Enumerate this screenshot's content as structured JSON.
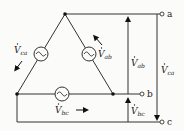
{
  "diagram": {
    "type": "delta-connected three-phase voltage source",
    "terminals": [
      {
        "id": "a",
        "label": "a"
      },
      {
        "id": "b",
        "label": "b"
      },
      {
        "id": "c",
        "label": "c"
      }
    ],
    "sources": [
      {
        "id": "Vca",
        "label_main": "V",
        "label_sub": "ca",
        "position": "left-leg"
      },
      {
        "id": "Vab",
        "label_main": "V",
        "label_sub": "ab",
        "position": "right-leg"
      },
      {
        "id": "Vbc",
        "label_main": "V",
        "label_sub": "bc",
        "position": "bottom"
      }
    ],
    "line_voltages": [
      {
        "id": "Vab_line",
        "label_main": "V",
        "label_sub": "ab",
        "from": "b",
        "to": "a",
        "arrow": "up"
      },
      {
        "id": "Vca_line",
        "label_main": "V",
        "label_sub": "ca",
        "from": "a",
        "to": "c",
        "arrow": "down"
      },
      {
        "id": "Vbc_line",
        "label_main": "V",
        "label_sub": "bc",
        "from": "c",
        "to": "b",
        "arrow": "up"
      }
    ],
    "colors": {
      "line": "#333333",
      "background": "#fbfbf9"
    }
  }
}
